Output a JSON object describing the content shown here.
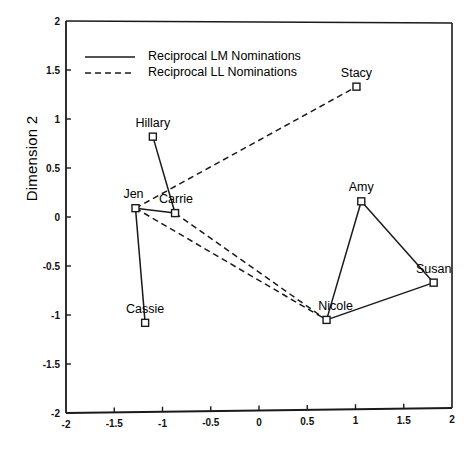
{
  "chart_data": {
    "type": "scatter",
    "title": "",
    "subtitle": "",
    "xlabel": "",
    "ylabel": "Dimension 2",
    "xlim": [
      -2,
      2
    ],
    "ylim": [
      -2,
      2
    ],
    "grid": false,
    "legend_position": "top-left",
    "x_ticks": [
      "-2",
      "-1.5",
      "-1",
      "-0.5",
      "0",
      "0.5",
      "1",
      "1.5",
      "2"
    ],
    "x_tick_values": [
      -2,
      -1.5,
      -1,
      -0.5,
      0,
      0.5,
      1,
      1.5,
      2
    ],
    "y_ticks": [
      "-2",
      "-1.5",
      "-1",
      "-0.5",
      "0",
      "0.5",
      "1",
      "1.5",
      "2"
    ],
    "y_tick_values": [
      -2,
      -1.5,
      -1,
      -0.5,
      0,
      0.5,
      1,
      1.5,
      2
    ],
    "marker": "open-square",
    "points": [
      {
        "label": "Stacy",
        "x": 1.01,
        "y": 1.33,
        "label_dx": 0,
        "label_dy": -13
      },
      {
        "label": "Hillary",
        "x": -1.1,
        "y": 0.82,
        "label_dx": 0,
        "label_dy": -13
      },
      {
        "label": "Jen",
        "x": -1.28,
        "y": 0.09,
        "label_dx": -2,
        "label_dy": -13
      },
      {
        "label": "Carrie",
        "x": -0.87,
        "y": 0.04,
        "label_dx": 1,
        "label_dy": -13
      },
      {
        "label": "Amy",
        "x": 1.06,
        "y": 0.16,
        "label_dx": 0,
        "label_dy": -13
      },
      {
        "label": "Susan",
        "x": 1.81,
        "y": -0.67,
        "label_dx": 0,
        "label_dy": -13
      },
      {
        "label": "Nicole",
        "x": 0.7,
        "y": -1.05,
        "label_dx": 9,
        "label_dy": -13
      },
      {
        "label": "Cassie",
        "x": -1.18,
        "y": -1.08,
        "label_dx": 0,
        "label_dy": -13
      }
    ],
    "series": [
      {
        "name": "Reciprocal LM Nominations",
        "style": "solid",
        "edges": [
          [
            "Hillary",
            "Carrie"
          ],
          [
            "Jen",
            "Carrie"
          ],
          [
            "Jen",
            "Cassie"
          ],
          [
            "Amy",
            "Nicole"
          ],
          [
            "Amy",
            "Susan"
          ],
          [
            "Nicole",
            "Susan"
          ]
        ]
      },
      {
        "name": "Reciprocal LL Nominations",
        "style": "dashed",
        "edges": [
          [
            "Jen",
            "Stacy"
          ],
          [
            "Jen",
            "Nicole"
          ],
          [
            "Carrie",
            "Nicole"
          ]
        ]
      }
    ]
  },
  "legend": {
    "entries": [
      {
        "label": "Reciprocal  LM  Nominations",
        "style": "solid"
      },
      {
        "label": "Reciprocal  LL  Nominations",
        "style": "dashed"
      }
    ]
  },
  "axes": {
    "y_title": "Dimension 2"
  }
}
